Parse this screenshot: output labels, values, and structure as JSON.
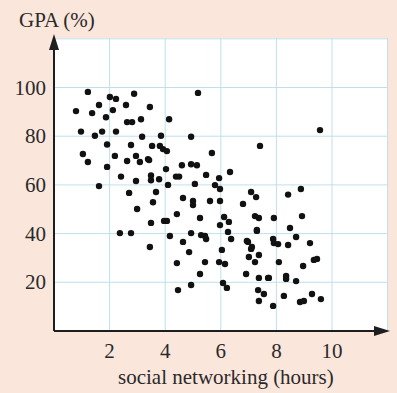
{
  "chart_data": {
    "type": "scatter",
    "title": "",
    "xlabel": "social networking (hours)",
    "ylabel": "GPA (%)",
    "xlim": [
      0,
      12.4
    ],
    "ylim": [
      0,
      120
    ],
    "xticks": [
      2,
      4,
      6,
      8,
      10
    ],
    "yticks": [
      20,
      40,
      60,
      80,
      100
    ],
    "grid": true,
    "legend": null,
    "colors": {
      "background": "#fbe6dc",
      "plot_area": "#ffffff",
      "grid": "#bfe0ea",
      "axis": "#1e1e1e",
      "points": "#111111"
    },
    "series": [
      {
        "name": "students",
        "points": [
          [
            1.22,
            98.2
          ],
          [
            2.01,
            96.1
          ],
          [
            2.23,
            95.3
          ],
          [
            1.62,
            92.8
          ],
          [
            0.79,
            90.3
          ],
          [
            1.37,
            89.5
          ],
          [
            2.12,
            90.7
          ],
          [
            1.87,
            87.8
          ],
          [
            0.97,
            81.9
          ],
          [
            1.73,
            81.9
          ],
          [
            1.47,
            80.2
          ],
          [
            2.23,
            81.9
          ],
          [
            1.91,
            76.6
          ],
          [
            1.04,
            72.7
          ],
          [
            2.19,
            71.9
          ],
          [
            1.22,
            69.4
          ],
          [
            1.91,
            67.4
          ],
          [
            2.41,
            63.4
          ],
          [
            1.62,
            59.5
          ],
          [
            2.37,
            40.2
          ],
          [
            2.88,
            97.4
          ],
          [
            2.59,
            92.8
          ],
          [
            3.45,
            92.0
          ],
          [
            2.63,
            85.8
          ],
          [
            2.81,
            85.8
          ],
          [
            3.13,
            87.0
          ],
          [
            4.14,
            87.0
          ],
          [
            3.17,
            79.8
          ],
          [
            3.85,
            80.2
          ],
          [
            2.77,
            76.4
          ],
          [
            3.53,
            76.0
          ],
          [
            3.81,
            76.0
          ],
          [
            3.92,
            74.7
          ],
          [
            4.06,
            73.9
          ],
          [
            2.95,
            71.9
          ],
          [
            3.38,
            70.6
          ],
          [
            2.63,
            69.8
          ],
          [
            3.09,
            69.4
          ],
          [
            3.42,
            70.2
          ],
          [
            4.03,
            66.5
          ],
          [
            4.6,
            68.1
          ],
          [
            2.95,
            61.6
          ],
          [
            3.49,
            63.9
          ],
          [
            3.49,
            61.9
          ],
          [
            3.78,
            62.3
          ],
          [
            4.1,
            60.0
          ],
          [
            4.39,
            63.4
          ],
          [
            4.5,
            63.4
          ],
          [
            2.7,
            56.7
          ],
          [
            3.67,
            57.1
          ],
          [
            4.64,
            54.6
          ],
          [
            3.56,
            52.9
          ],
          [
            2.99,
            50.1
          ],
          [
            4.42,
            48.0
          ],
          [
            3.49,
            44.4
          ],
          [
            3.96,
            45.2
          ],
          [
            4.06,
            45.2
          ],
          [
            2.77,
            40.2
          ],
          [
            4.17,
            39.0
          ],
          [
            3.45,
            34.5
          ],
          [
            4.64,
            36.6
          ],
          [
            4.93,
            40.2
          ],
          [
            5.29,
            39.4
          ],
          [
            5.43,
            39.0
          ],
          [
            5.47,
            37.8
          ],
          [
            4.86,
            32.4
          ],
          [
            4.42,
            27.9
          ],
          [
            5.43,
            28.3
          ],
          [
            5.94,
            28.3
          ],
          [
            5.25,
            23.4
          ],
          [
            4.93,
            18.9
          ],
          [
            4.46,
            16.8
          ],
          [
            5.18,
            97.8
          ],
          [
            4.93,
            79.8
          ],
          [
            5.68,
            73.1
          ],
          [
            4.93,
            68.5
          ],
          [
            5.14,
            68.1
          ],
          [
            5.47,
            64.1
          ],
          [
            6.33,
            65.3
          ],
          [
            5.07,
            60.4
          ],
          [
            5.79,
            59.9
          ],
          [
            5.94,
            62.8
          ],
          [
            5.97,
            58.3
          ],
          [
            4.999,
            53.4
          ],
          [
            5.0,
            51.7
          ],
          [
            5.61,
            53.4
          ],
          [
            5.97,
            53.4
          ],
          [
            5.25,
            46.4
          ],
          [
            6.12,
            46.8
          ],
          [
            6.29,
            44.8
          ],
          [
            5.97,
            43.5
          ],
          [
            6.26,
            40.7
          ],
          [
            6.37,
            37.8
          ],
          [
            7.3,
            41.5
          ],
          [
            6.98,
            36.6
          ],
          [
            7.09,
            33.7
          ],
          [
            7.88,
            37.8
          ],
          [
            6.04,
            33.3
          ],
          [
            6.15,
            27.5
          ],
          [
            7.01,
            30.4
          ],
          [
            7.37,
            31.2
          ],
          [
            7.23,
            28.3
          ],
          [
            6.91,
            23.4
          ],
          [
            7.37,
            21.8
          ],
          [
            7.7,
            21.8
          ],
          [
            6.08,
            19.7
          ],
          [
            6.22,
            17.7
          ],
          [
            7.34,
            16.8
          ],
          [
            7.55,
            15.2
          ],
          [
            7.37,
            12.3
          ],
          [
            7.09,
            57.1
          ],
          [
            7.27,
            55.0
          ],
          [
            6.8,
            52.2
          ],
          [
            8.42,
            56.0
          ],
          [
            8.88,
            58.3
          ],
          [
            7.23,
            47.2
          ],
          [
            7.37,
            46.4
          ],
          [
            7.91,
            46.4
          ],
          [
            8.92,
            47.2
          ],
          [
            7.3,
            41.1
          ],
          [
            8.49,
            42.3
          ],
          [
            6.94,
            37.0
          ],
          [
            7.12,
            34.5
          ],
          [
            7.91,
            36.1
          ],
          [
            8.06,
            35.7
          ],
          [
            8.42,
            35.3
          ],
          [
            8.71,
            38.6
          ],
          [
            9.21,
            36.1
          ],
          [
            8.09,
            28.3
          ],
          [
            8.96,
            26.7
          ],
          [
            9.35,
            29.2
          ],
          [
            9.46,
            29.6
          ],
          [
            7.73,
            21.8
          ],
          [
            8.35,
            22.6
          ],
          [
            8.35,
            21.4
          ],
          [
            8.71,
            20.5
          ],
          [
            8.27,
            14.4
          ],
          [
            7.88,
            10.3
          ],
          [
            8.85,
            11.9
          ],
          [
            8.99,
            12.3
          ],
          [
            9.28,
            15.2
          ],
          [
            9.6,
            13.1
          ],
          [
            9.57,
            82.5
          ],
          [
            7.41,
            76.0
          ]
        ]
      }
    ]
  },
  "labels": {
    "y_axis_title": "GPA (%)",
    "x_axis_title": "social networking (hours)",
    "x_ticks": [
      "2",
      "4",
      "6",
      "8",
      "10"
    ],
    "y_ticks": [
      "20",
      "40",
      "60",
      "80",
      "100"
    ]
  }
}
